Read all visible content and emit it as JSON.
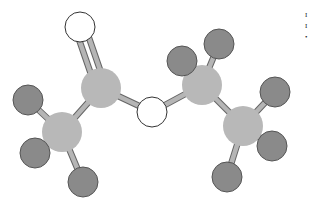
{
  "diagram": {
    "type": "ball-and-stick molecular model",
    "colors": {
      "carbon": "#b8b8b8",
      "hydrogen": "#8a8a8a",
      "hydrogen_stroke": "#555555",
      "oxygen": "#ffffff",
      "oxygen_stroke": "#333333",
      "bond": "#b5b5b5",
      "bond_stroke": "#666666"
    },
    "atoms": [
      {
        "id": "O1",
        "element": "O",
        "x": 80,
        "y": 27,
        "r": 15
      },
      {
        "id": "C1",
        "element": "C",
        "x": 101,
        "y": 88,
        "r": 20
      },
      {
        "id": "C2",
        "element": "C",
        "x": 62,
        "y": 132,
        "r": 20
      },
      {
        "id": "O2",
        "element": "O",
        "x": 152,
        "y": 112,
        "r": 15
      },
      {
        "id": "C3",
        "element": "C",
        "x": 202,
        "y": 85,
        "r": 20
      },
      {
        "id": "C4",
        "element": "C",
        "x": 243,
        "y": 126,
        "r": 20
      },
      {
        "id": "H1",
        "element": "H",
        "x": 28,
        "y": 100,
        "r": 15
      },
      {
        "id": "H2",
        "element": "H",
        "x": 35,
        "y": 153,
        "r": 15
      },
      {
        "id": "H3",
        "element": "H",
        "x": 83,
        "y": 182,
        "r": 15
      },
      {
        "id": "H4",
        "element": "H",
        "x": 182,
        "y": 61,
        "r": 15
      },
      {
        "id": "H5",
        "element": "H",
        "x": 219,
        "y": 44,
        "r": 15
      },
      {
        "id": "H6",
        "element": "H",
        "x": 275,
        "y": 92,
        "r": 15
      },
      {
        "id": "H7",
        "element": "H",
        "x": 272,
        "y": 146,
        "r": 15
      },
      {
        "id": "H8",
        "element": "H",
        "x": 227,
        "y": 177,
        "r": 15
      }
    ],
    "bonds": [
      {
        "from": "O1",
        "to": "C1",
        "order": 2
      },
      {
        "from": "C1",
        "to": "C2",
        "order": 1
      },
      {
        "from": "C1",
        "to": "O2",
        "order": 1
      },
      {
        "from": "O2",
        "to": "C3",
        "order": 1
      },
      {
        "from": "C3",
        "to": "C4",
        "order": 1
      },
      {
        "from": "C2",
        "to": "H1",
        "order": 1
      },
      {
        "from": "C2",
        "to": "H2",
        "order": 1
      },
      {
        "from": "C2",
        "to": "H3",
        "order": 1
      },
      {
        "from": "C3",
        "to": "H4",
        "order": 1
      },
      {
        "from": "C3",
        "to": "H5",
        "order": 1
      },
      {
        "from": "C4",
        "to": "H6",
        "order": 1
      },
      {
        "from": "C4",
        "to": "H7",
        "order": 1
      },
      {
        "from": "C4",
        "to": "H8",
        "order": 1
      }
    ]
  },
  "edge_text": [
    "I",
    "I",
    "•"
  ]
}
